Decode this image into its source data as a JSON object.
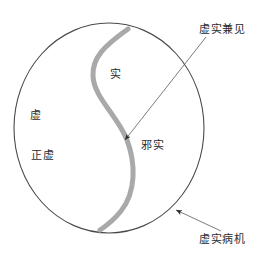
{
  "figure": {
    "title_alt": "虚实病机示意图",
    "colors": {
      "outline": "#4a4a4a",
      "curve": "#a9a9a9",
      "leader": "#5a5a5a",
      "text": "#2b2b2b",
      "background": "#ffffff"
    },
    "inner_labels": [
      {
        "key": "xu",
        "text": "虚"
      },
      {
        "key": "zhengxu",
        "text": "正虚"
      },
      {
        "key": "shi",
        "text": "实"
      },
      {
        "key": "xieshi",
        "text": "邪实"
      }
    ],
    "callouts": [
      {
        "key": "jianjian",
        "text": "虚实兼见"
      },
      {
        "key": "bingji",
        "text": "虚实病机"
      }
    ]
  }
}
